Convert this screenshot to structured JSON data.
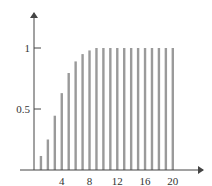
{
  "chart_data": {
    "type": "bar",
    "title": "",
    "xlabel": "",
    "ylabel": "",
    "categories": [
      1,
      2,
      3,
      4,
      5,
      6,
      7,
      8,
      9,
      10,
      11,
      12,
      13,
      14,
      15,
      16,
      17,
      18,
      19,
      20
    ],
    "values": [
      0.115,
      0.25,
      0.445,
      0.63,
      0.795,
      0.89,
      0.95,
      0.98,
      1,
      1,
      1,
      1,
      1,
      1,
      1,
      1,
      1,
      1,
      1,
      1
    ],
    "xlim": [
      0,
      24
    ],
    "ylim": [
      0,
      1.3
    ],
    "x_ticks": [
      4,
      8,
      12,
      16,
      20
    ],
    "y_ticks": [
      0.5,
      1
    ],
    "x_tick_labels": [
      "4",
      "8",
      "12",
      "16",
      "20"
    ],
    "y_tick_labels": [
      "0.5",
      "1"
    ],
    "grid": false,
    "legend": null,
    "style": "stem-bars"
  },
  "colors": {
    "bar": "#9a9a9a",
    "axis": "#444444",
    "text": "#333333"
  }
}
